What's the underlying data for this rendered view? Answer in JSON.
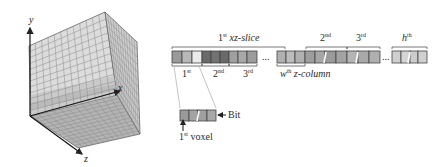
{
  "cube": {
    "axes": {
      "x": "x",
      "y": "y",
      "z": "z"
    },
    "grid_divisions": 12,
    "colors": {
      "front": "#d9d9d9",
      "side": "#bfbfbf",
      "bottom": "#a8a8a8",
      "grid": "#7a7a7a",
      "highlight_band": "#c8c8c8"
    }
  },
  "bitstream": {
    "top_labels": {
      "slice1_num": "1",
      "slice1_sup": "st",
      "slice1_text": "xz-slice",
      "slice2_num": "2",
      "slice2_sup": "nd",
      "slice3_num": "3",
      "slice3_sup": "rd",
      "sliceh_var": "h",
      "sliceh_sup": "th"
    },
    "bottom_labels": {
      "col1_num": "1",
      "col1_sup": "st",
      "col2_num": "2",
      "col2_sup": "nd",
      "col3_num": "3",
      "col3_sup": "rd",
      "colw_var": "w",
      "colw_sup": "th",
      "colw_text": "z-column"
    },
    "ellipsis": "...",
    "colors": {
      "voxel_light": "#e8e8e8",
      "voxel_mid": "#a9a9a9",
      "voxel_dark": "#6f6f6f",
      "border": "#444444"
    }
  },
  "zoom_detail": {
    "bit_label": "Bit",
    "voxel_num": "1",
    "voxel_sup": "st",
    "voxel_text": "voxel"
  }
}
